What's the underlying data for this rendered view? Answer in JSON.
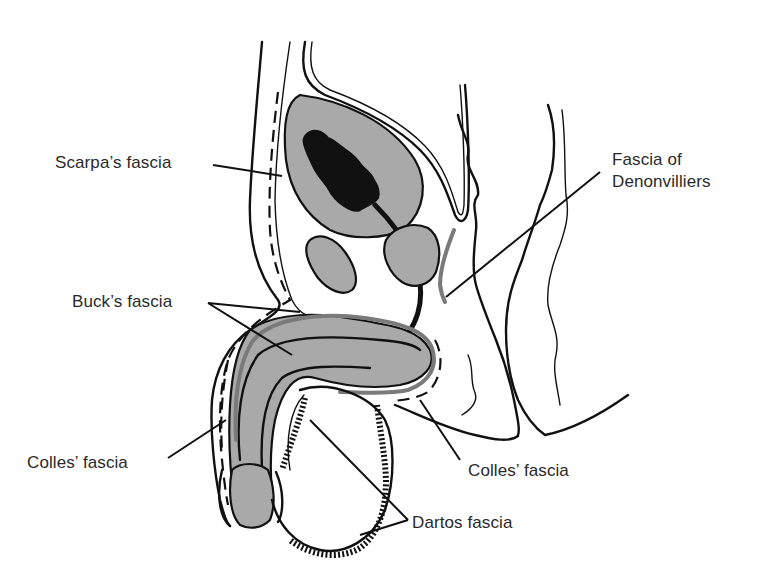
{
  "diagram": {
    "colors": {
      "background": "#ffffff",
      "ink": "#111111",
      "organ_fill": "#a9a9a9",
      "gray_fascia": "#7a7a7a",
      "label_text": "#2a2a2a"
    },
    "labels": {
      "scarpas_fascia": "Scarpa’s fascia",
      "fascia_of_denonvilliers_line1": "Fascia of",
      "fascia_of_denonvilliers_line2": "Denonvilliers",
      "bucks_fascia": "Buck’s fascia",
      "colles_fascia_left": "Colles’ fascia",
      "colles_fascia_right": "Colles’ fascia",
      "dartos_fascia": "Dartos fascia"
    },
    "structures": [
      "bladder",
      "bladder-lumen",
      "prostate",
      "seminal-vesicle",
      "pubic-bone",
      "urethra",
      "penis-corpora",
      "glans",
      "scrotum",
      "rectum",
      "anal-canal",
      "abdominal-wall"
    ]
  }
}
